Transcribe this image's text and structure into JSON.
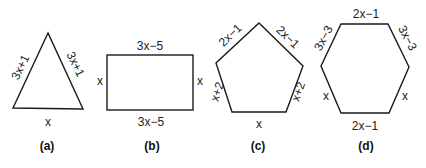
{
  "figures": [
    {
      "id": "a",
      "caption": "(a)",
      "shape": "triangle",
      "labels": {
        "left": "3x+1",
        "right": "3x+1",
        "bottom": "x"
      }
    },
    {
      "id": "b",
      "caption": "(b)",
      "shape": "rectangle",
      "labels": {
        "top": "3x−5",
        "bottom": "3x−5",
        "left": "x",
        "right": "x"
      }
    },
    {
      "id": "c",
      "caption": "(c)",
      "shape": "pentagon",
      "labels": {
        "top_left": "2x−1",
        "top_right": "2x−1",
        "lower_left": "x+2",
        "lower_right": "x+2",
        "bottom": "x"
      }
    },
    {
      "id": "d",
      "caption": "(d)",
      "shape": "hexagon",
      "labels": {
        "top": "2x−1",
        "upper_left": "3x−3",
        "upper_right": "3x−3",
        "lower_left": "x",
        "lower_right": "x",
        "bottom": "2x−1"
      }
    }
  ]
}
